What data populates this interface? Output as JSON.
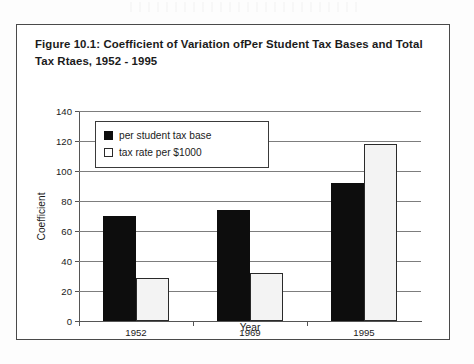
{
  "figure": {
    "caption": "Figure 10.1: Coefficient of Variation ofPer Student Tax Bases and Total Tax Rtaes, 1952 - 1995"
  },
  "chart_data": {
    "type": "bar",
    "title": "Figure 10.1: Coefficient of Variation ofPer Student Tax Bases and Total Tax Rtaes, 1952 - 1995",
    "categories": [
      "1952",
      "1969",
      "1995"
    ],
    "series": [
      {
        "name": "per student tax base",
        "values": [
          70,
          74,
          92
        ],
        "color": "#0d0d0d"
      },
      {
        "name": "tax rate per $1000",
        "values": [
          29,
          32,
          118
        ],
        "color": "#ffffff"
      }
    ],
    "xlabel": "Year",
    "ylabel": "Coefficient",
    "ylim": [
      0,
      140
    ],
    "yticks": [
      0,
      20,
      40,
      60,
      80,
      100,
      120,
      140
    ],
    "ytick_labels": [
      "0",
      "20",
      "40",
      "60",
      "80",
      "100",
      "120",
      "140"
    ],
    "grid": true,
    "legend_position": "upper-left-inside"
  }
}
